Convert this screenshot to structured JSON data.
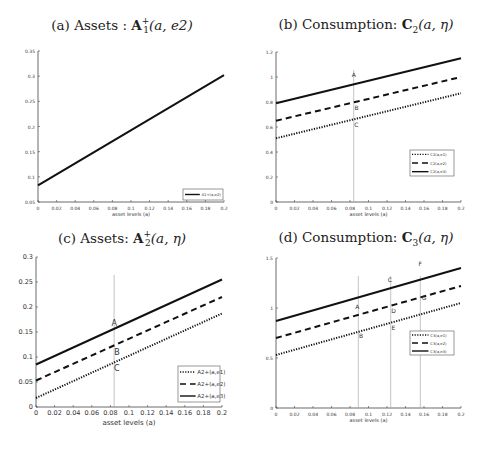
{
  "chart_data": [
    {
      "id": "a",
      "type": "line",
      "title": "(a) Assets : A1+(a, e2)",
      "title_parts": {
        "prefix": "(a) Assets : ",
        "bold": "A",
        "sup": "+",
        "sub": "1",
        "args": "(a, e2)"
      },
      "xlabel": "asset levels (a)",
      "ylabel": "",
      "xlim": [
        0,
        0.2
      ],
      "ylim": [
        0.05,
        0.35
      ],
      "xticks": [
        0,
        0.02,
        0.04,
        0.06,
        0.08,
        0.1,
        0.12,
        0.14,
        0.16,
        0.18,
        0.2
      ],
      "xtick_labels": [
        "0",
        "0.02",
        "0.04",
        "0.06",
        "0.08",
        "0.1",
        "0.12",
        "0.14",
        "0.16",
        "0.18",
        "0.2"
      ],
      "yticks": [
        0.05,
        0.1,
        0.15,
        0.2,
        0.25,
        0.3,
        0.35
      ],
      "ytick_labels": [
        "0.05",
        "0.1",
        "0.15",
        "0.2",
        "0.25",
        "0.3",
        "0.35"
      ],
      "grid": false,
      "legend_position": "lower right",
      "series": [
        {
          "name": "A1+(a,e2)",
          "style": "solid",
          "x": [
            0,
            0.2
          ],
          "values": [
            0.083,
            0.302
          ]
        }
      ],
      "vlines": [],
      "annotations": []
    },
    {
      "id": "b",
      "type": "line",
      "title": "(b) Consumption: C2(a, η)",
      "title_parts": {
        "prefix": "(b) Consumption: ",
        "bold": "C",
        "sup": "",
        "sub": "2",
        "args": "(a, η)"
      },
      "xlabel": "asset levels (a)",
      "ylabel": "",
      "xlim": [
        0,
        0.2
      ],
      "ylim": [
        0,
        1.2
      ],
      "xticks": [
        0,
        0.02,
        0.04,
        0.06,
        0.08,
        0.1,
        0.12,
        0.14,
        0.16,
        0.18,
        0.2
      ],
      "xtick_labels": [
        "0",
        "0.02",
        "0.04",
        "0.06",
        "0.08",
        "0.1",
        "0.12",
        "0.14",
        "0.16",
        "0.18",
        "0.2"
      ],
      "yticks": [
        0,
        0.2,
        0.4,
        0.6,
        0.8,
        1,
        1.2
      ],
      "ytick_labels": [
        "0",
        "0.2",
        "0.4",
        "0.6",
        "0.8",
        "1",
        "1.2"
      ],
      "grid": false,
      "legend_position": "center right",
      "series": [
        {
          "name": "C2(a,e1)",
          "style": "dotted",
          "x": [
            0,
            0.2
          ],
          "values": [
            0.51,
            0.87
          ]
        },
        {
          "name": "C2(a,e2)",
          "style": "dashed",
          "x": [
            0,
            0.2
          ],
          "values": [
            0.65,
            1.0
          ]
        },
        {
          "name": "C2(a,e3)",
          "style": "solid",
          "x": [
            0,
            0.2
          ],
          "values": [
            0.79,
            1.15
          ]
        }
      ],
      "vlines": [
        0.084
      ],
      "annotations": [
        {
          "text": "A",
          "x": 0.084,
          "y": 1.0
        },
        {
          "text": "B",
          "x": 0.087,
          "y": 0.74
        },
        {
          "text": "C",
          "x": 0.087,
          "y": 0.6
        }
      ]
    },
    {
      "id": "c",
      "type": "line",
      "title": "(c) Assets: A2+(a, η)",
      "title_parts": {
        "prefix": "(c) Assets: ",
        "bold": "A",
        "sup": "+",
        "sub": "2",
        "args": "(a, η)"
      },
      "xlabel": "asset levels (a)",
      "ylabel": "",
      "xlim": [
        0,
        0.2
      ],
      "ylim": [
        0,
        0.3
      ],
      "xticks": [
        0,
        0.02,
        0.04,
        0.06,
        0.08,
        0.1,
        0.12,
        0.14,
        0.16,
        0.18,
        0.2
      ],
      "xtick_labels": [
        "0",
        "0.02",
        "0.04",
        "0.06",
        "0.08",
        "0.1",
        "0.12",
        "0.14",
        "0.16",
        "0.18",
        "0.2"
      ],
      "yticks": [
        0,
        0.05,
        0.1,
        0.15,
        0.2,
        0.25,
        0.3
      ],
      "ytick_labels": [
        "0",
        "0.05",
        "0.1",
        "0.15",
        "0.2",
        "0.25",
        "0.3"
      ],
      "grid": false,
      "legend_position": "lower right",
      "series": [
        {
          "name": "A2+(a,e1)",
          "style": "dotted",
          "x": [
            0,
            0.2
          ],
          "values": [
            0.018,
            0.187
          ]
        },
        {
          "name": "A2+(a,e2)",
          "style": "dashed",
          "x": [
            0,
            0.2
          ],
          "values": [
            0.053,
            0.22
          ]
        },
        {
          "name": "A2+(a,e3)",
          "style": "solid",
          "x": [
            0,
            0.2
          ],
          "values": [
            0.085,
            0.255
          ]
        }
      ],
      "vlines": [
        0.084
      ],
      "annotations": [
        {
          "text": "A",
          "x": 0.084,
          "y": 0.162
        },
        {
          "text": "B",
          "x": 0.087,
          "y": 0.104
        },
        {
          "text": "C",
          "x": 0.087,
          "y": 0.073
        }
      ]
    },
    {
      "id": "d",
      "type": "line",
      "title": "(d) Consumption: C3(a, η)",
      "title_parts": {
        "prefix": "(d) Consumption: ",
        "bold": "C",
        "sup": "",
        "sub": "3",
        "args": "(a, η)"
      },
      "xlabel": "asset levels (a)",
      "ylabel": "",
      "xlim": [
        0,
        0.2
      ],
      "ylim": [
        0,
        1.5
      ],
      "xticks": [
        0,
        0.02,
        0.04,
        0.06,
        0.08,
        0.1,
        0.12,
        0.14,
        0.16,
        0.18,
        0.2
      ],
      "xtick_labels": [
        "0",
        "0.02",
        "0.04",
        "0.06",
        "0.08",
        "0.1",
        "0.12",
        "0.14",
        "0.16",
        "0.18",
        "0.2"
      ],
      "yticks": [
        0,
        0.5,
        1,
        1.5
      ],
      "ytick_labels": [
        "0",
        "0.5",
        "1",
        "1.5"
      ],
      "grid": false,
      "legend_position": "center right",
      "series": [
        {
          "name": "C3(a,e1)",
          "style": "dotted",
          "x": [
            0,
            0.2
          ],
          "values": [
            0.53,
            1.05
          ]
        },
        {
          "name": "C3(a,e2)",
          "style": "dashed",
          "x": [
            0,
            0.2
          ],
          "values": [
            0.7,
            1.22
          ]
        },
        {
          "name": "C3(a,e3)",
          "style": "solid",
          "x": [
            0,
            0.2
          ],
          "values": [
            0.87,
            1.4
          ]
        }
      ],
      "vlines": [
        0.089,
        0.124,
        0.156
      ],
      "annotations": [
        {
          "text": "A",
          "x": 0.088,
          "y": 0.99
        },
        {
          "text": "B",
          "x": 0.092,
          "y": 0.7
        },
        {
          "text": "C",
          "x": 0.123,
          "y": 1.26
        },
        {
          "text": "D",
          "x": 0.127,
          "y": 0.95
        },
        {
          "text": "E",
          "x": 0.127,
          "y": 0.78
        },
        {
          "text": "F",
          "x": 0.156,
          "y": 1.42
        },
        {
          "text": "G",
          "x": 0.16,
          "y": 1.08
        }
      ]
    }
  ],
  "layout": {
    "panels": [
      {
        "id": "a",
        "left": 0,
        "top": 0,
        "title_top": 16,
        "plot": {
          "x0": 38,
          "x1": 224,
          "y0": 202,
          "y1": 51
        },
        "legend": {
          "x": 183,
          "y": 189,
          "w": 40,
          "h": 11
        }
      },
      {
        "id": "b",
        "left": 244,
        "top": 0,
        "title_top": 16,
        "plot": {
          "x0": 32,
          "x1": 217,
          "y0": 202,
          "y1": 52
        },
        "legend": {
          "x": 166,
          "y": 150,
          "w": 44,
          "h": 26
        }
      },
      {
        "id": "c",
        "left": 0,
        "top": 228,
        "title_top": 1,
        "plot": {
          "x0": 36,
          "x1": 222,
          "y0": 179,
          "y1": 29
        },
        "legend": {
          "x": 178,
          "y": 138,
          "w": 42,
          "h": 36
        }
      },
      {
        "id": "d",
        "left": 244,
        "top": 228,
        "title_top": 1,
        "plot": {
          "x0": 32,
          "x1": 217,
          "y0": 180,
          "y1": 30
        },
        "legend": {
          "x": 166,
          "y": 103,
          "w": 44,
          "h": 24
        }
      }
    ]
  }
}
